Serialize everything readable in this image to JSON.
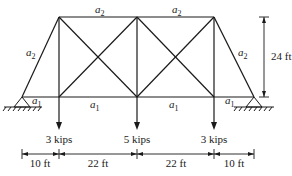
{
  "diagram": {
    "type": "truss",
    "members": {
      "top_chord_label": "a2",
      "bottom_chord_label": "a1",
      "end_diagonal_label": "a2",
      "end_bottom_label": "a1",
      "labels": [
        {
          "id": "top-left",
          "base": "a",
          "sub": "2"
        },
        {
          "id": "top-right",
          "base": "a",
          "sub": "2"
        },
        {
          "id": "left-diagonal",
          "base": "a",
          "sub": "2"
        },
        {
          "id": "right-diagonal",
          "base": "a",
          "sub": "2"
        },
        {
          "id": "bottom-left-end",
          "base": "a",
          "sub": "1"
        },
        {
          "id": "bottom-left-mid",
          "base": "a",
          "sub": "1"
        },
        {
          "id": "bottom-right-mid",
          "base": "a",
          "sub": "1"
        },
        {
          "id": "bottom-right-end",
          "base": "a",
          "sub": "1"
        }
      ]
    },
    "loads": [
      {
        "label": "3 kips",
        "value": 3,
        "unit": "kips"
      },
      {
        "label": "5 kips",
        "value": 5,
        "unit": "kips"
      },
      {
        "label": "3 kips",
        "value": 3,
        "unit": "kips"
      }
    ],
    "dimensions": {
      "height": "24 ft",
      "spans": [
        "10 ft",
        "22 ft",
        "22 ft",
        "10 ft"
      ]
    },
    "supports": [
      "pinned",
      "pinned"
    ]
  }
}
